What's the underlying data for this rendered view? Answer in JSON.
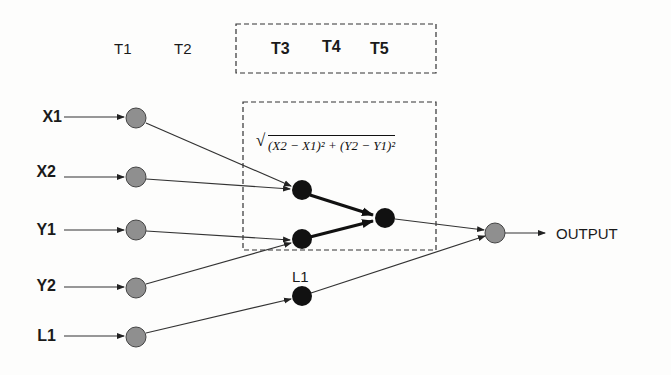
{
  "diagram": {
    "time_labels": {
      "t1": "T1",
      "t2": "T2",
      "t3": "T3",
      "t4": "T4",
      "t5": "T5"
    },
    "inputs": [
      {
        "label": "X1"
      },
      {
        "label": "X2"
      },
      {
        "label": "Y1"
      },
      {
        "label": "Y2"
      },
      {
        "label": "L1"
      }
    ],
    "hidden_label": "L1",
    "formula": "(X2 − X1)² + (Y2 − Y1)²",
    "formula_symbol": "√",
    "output_label": "OUTPUT",
    "colors": {
      "input_node": "#8f8f8f",
      "hidden_node": "#111111",
      "output_node": "#8f8f8f",
      "line": "#333333",
      "dashed_box": "#333333"
    }
  }
}
